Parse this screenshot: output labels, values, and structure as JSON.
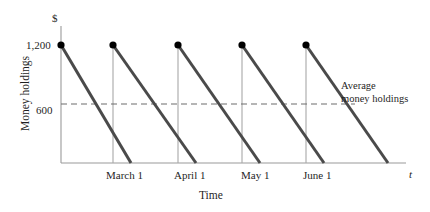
{
  "chart_data": {
    "type": "line",
    "title": "",
    "subtitle": "",
    "xlabel": "Time",
    "ylabel": "Money holdings",
    "y_unit_symbol": "$",
    "x_axis_symbol": "t",
    "grid": false,
    "legend_position": "none",
    "ylim": [
      0,
      1350
    ],
    "ytick_values": [
      600,
      1200
    ],
    "ytick_labels": [
      "600",
      "1,200"
    ],
    "xtick_labels": [
      "March 1",
      "April 1",
      "May 1",
      "June 1"
    ],
    "xtick_positions": [
      131,
      196,
      260,
      324
    ],
    "series": [
      {
        "name": "Money holdings",
        "description": "Sawtooth: holdings jump to 1,200 at each month start then decline linearly to 0",
        "peak_value": 1200,
        "trough_value": 0,
        "cycles": 4,
        "points": [
          {
            "x": 61,
            "y": 1200
          },
          {
            "x": 131,
            "y": 0
          },
          {
            "x": 113,
            "y": 1200
          },
          {
            "x": 196,
            "y": 0
          },
          {
            "x": 178,
            "y": 1200
          },
          {
            "x": 260,
            "y": 0
          },
          {
            "x": 242,
            "y": 1200
          },
          {
            "x": 324,
            "y": 0
          },
          {
            "x": 306,
            "y": 1200
          }
        ]
      }
    ],
    "reference_line": {
      "label_line1": "Average",
      "label_line2": "money holdings",
      "value": 600,
      "style": "dashed"
    },
    "markers": {
      "shape": "filled-circle",
      "count": 5,
      "value": 1200
    },
    "colors": {
      "series_line": "#4a4a4a",
      "axis": "#9a9a9a",
      "marker": "#000000",
      "dashed_line": "#6d6d6d",
      "drop_line": "#a8a8a8",
      "text": "#1f1f1f",
      "background": "#ffffff"
    }
  },
  "labels": {
    "currency": "$",
    "y_tick_high": "1,200",
    "y_tick_mid": "600",
    "y_axis_title": "Money holdings",
    "x_axis_title": "Time",
    "x_axis_symbol": "t",
    "x_tick_1": "March 1",
    "x_tick_2": "April 1",
    "x_tick_3": "May 1",
    "x_tick_4": "June 1",
    "annotation_line_1": "Average",
    "annotation_line_2": "money holdings"
  }
}
